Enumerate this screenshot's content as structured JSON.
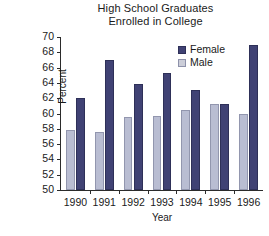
{
  "chart_data": {
    "type": "bar",
    "title": "High School Graduates Enrolled in College",
    "title_lines": [
      "High School Graduates",
      "Enrolled in College"
    ],
    "xlabel": "Year",
    "ylabel": "Percent",
    "categories": [
      "1990",
      "1991",
      "1992",
      "1993",
      "1994",
      "1995",
      "1996"
    ],
    "series": [
      {
        "name": "Female",
        "color": "#404274",
        "values": [
          62.0,
          67.0,
          63.8,
          65.3,
          63.1,
          61.2,
          69.0
        ]
      },
      {
        "name": "Male",
        "color": "#b9bdd2",
        "values": [
          57.8,
          57.6,
          59.5,
          59.7,
          60.4,
          61.3,
          59.9
        ]
      }
    ],
    "ylim": [
      50,
      70
    ],
    "ytick_step": 2,
    "yticks": [
      70,
      68,
      66,
      64,
      62,
      60,
      58,
      56,
      54,
      52,
      50
    ],
    "grid": false,
    "legend_position": "top-right",
    "legend_entries": [
      "Female",
      "Male"
    ]
  }
}
